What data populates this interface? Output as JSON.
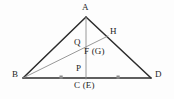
{
  "figure": {
    "background_color": "#fdfdfd",
    "stroke_dark": "#2b2b2b",
    "stroke_light": "#8c8c8c",
    "tick_color": "#8c8c8c"
  },
  "labels": {
    "apex": "A",
    "right_upper": "H",
    "interior_upper": "Q",
    "interior_mid": "F (G)",
    "base_interior": "P",
    "left_vertex": "B",
    "right_vertex": "D",
    "base_midpoint": "C (E)"
  },
  "geometry": {
    "points": {
      "A": {
        "x": 86,
        "y": 17
      },
      "B": {
        "x": 23,
        "y": 78
      },
      "D": {
        "x": 151,
        "y": 78
      },
      "H": {
        "x": 108,
        "y": 36
      },
      "C": {
        "x": 86,
        "y": 78
      },
      "Q": {
        "x": 86,
        "y": 44
      },
      "F": {
        "x": 86,
        "y": 52
      },
      "P": {
        "x": 86,
        "y": 70
      }
    },
    "segments": [
      {
        "name": "AB",
        "from": "A",
        "to": "B",
        "weight": "dark"
      },
      {
        "name": "AD",
        "from": "A",
        "to": "D",
        "weight": "dark"
      },
      {
        "name": "BD",
        "from": "B",
        "to": "D",
        "weight": "dark"
      },
      {
        "name": "BH",
        "from": "B",
        "to": "H",
        "weight": "light"
      },
      {
        "name": "AC",
        "from": "A",
        "to": "C",
        "weight": "light"
      }
    ],
    "tick_marks": [
      {
        "name": "tick-left",
        "x": 61,
        "y": 78
      },
      {
        "name": "tick-right",
        "x": 118,
        "y": 78
      }
    ]
  }
}
